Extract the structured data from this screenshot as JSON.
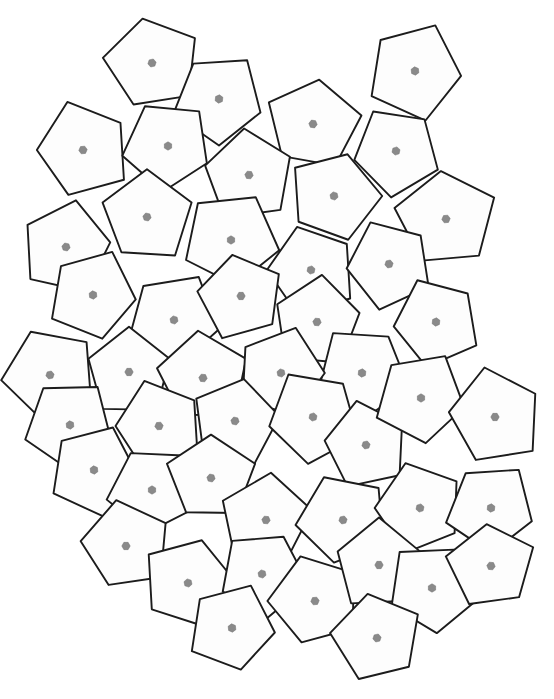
{
  "figure": {
    "kind": "geometric-tiling-diagram",
    "title": "",
    "caption": "",
    "background_color": "#ffffff",
    "canvas": {
      "width": 554,
      "height": 699
    }
  },
  "style": {
    "tile_fill": "#fdfdfd",
    "tile_stroke": "#1c1c1c",
    "tile_stroke_width": 1.9,
    "petal_light_fill": "#ededed",
    "petal_light_stroke": "#c9c9c9",
    "spine_fill": "#8f8f8f",
    "spine_stroke": "#7a7a7a",
    "ray_stroke": "#b4b4b4",
    "web_stroke": "#cdcdcd",
    "hub_fill": "#8a8a8a",
    "hub_stroke": "#6e6e6e"
  },
  "motif": {
    "name": "six-petal-rosette",
    "petal_count": 6,
    "spine_count": 6,
    "ray_count": 24,
    "hub_shape": "hexagon",
    "hub_radius": 4.2,
    "description": "Each pentagonal tile carries a six-fold rosette: light grey petals between darker grey lens-shaped spines radiating from a small grey hexagonal hub, overlaid by a fine grey web of straight rays."
  },
  "tiling": {
    "tile_shape": "pentagon",
    "tile_count": 48,
    "nominal_tile_radius": 46,
    "tiles": [
      {
        "id": "t01",
        "cx": 152,
        "cy": 63,
        "r": 48,
        "rot": -12
      },
      {
        "id": "t02",
        "cx": 219,
        "cy": 99,
        "r": 46,
        "rot": 36
      },
      {
        "id": "t03",
        "cx": 313,
        "cy": 124,
        "r": 47,
        "rot": 8
      },
      {
        "id": "t04",
        "cx": 415,
        "cy": 71,
        "r": 49,
        "rot": 24
      },
      {
        "id": "t05",
        "cx": 83,
        "cy": 150,
        "r": 48,
        "rot": 54
      },
      {
        "id": "t06",
        "cx": 168,
        "cy": 146,
        "r": 45,
        "rot": -30
      },
      {
        "id": "t07",
        "cx": 249,
        "cy": 175,
        "r": 47,
        "rot": 66
      },
      {
        "id": "t08",
        "cx": 334,
        "cy": 196,
        "r": 46,
        "rot": 18
      },
      {
        "id": "t09",
        "cx": 396,
        "cy": 151,
        "r": 45,
        "rot": 42
      },
      {
        "id": "t10",
        "cx": 446,
        "cy": 219,
        "r": 50,
        "rot": -6
      },
      {
        "id": "t11",
        "cx": 66,
        "cy": 247,
        "r": 47,
        "rot": 12
      },
      {
        "id": "t12",
        "cx": 147,
        "cy": 217,
        "r": 46,
        "rot": 72
      },
      {
        "id": "t13",
        "cx": 231,
        "cy": 240,
        "r": 48,
        "rot": 30
      },
      {
        "id": "t14",
        "cx": 311,
        "cy": 270,
        "r": 46,
        "rot": -18
      },
      {
        "id": "t15",
        "cx": 389,
        "cy": 264,
        "r": 45,
        "rot": 48
      },
      {
        "id": "t16",
        "cx": 93,
        "cy": 295,
        "r": 45,
        "rot": 24
      },
      {
        "id": "t17",
        "cx": 174,
        "cy": 320,
        "r": 47,
        "rot": -42
      },
      {
        "id": "t18",
        "cx": 241,
        "cy": 296,
        "r": 44,
        "rot": 60
      },
      {
        "id": "t19",
        "cx": 317,
        "cy": 322,
        "r": 46,
        "rot": 6
      },
      {
        "id": "t20",
        "cx": 362,
        "cy": 373,
        "r": 47,
        "rot": 36
      },
      {
        "id": "t21",
        "cx": 436,
        "cy": 322,
        "r": 45,
        "rot": -24
      },
      {
        "id": "t22",
        "cx": 50,
        "cy": 375,
        "r": 47,
        "rot": 48
      },
      {
        "id": "t23",
        "cx": 129,
        "cy": 372,
        "r": 45,
        "rot": 0
      },
      {
        "id": "t24",
        "cx": 203,
        "cy": 378,
        "r": 46,
        "rot": 66
      },
      {
        "id": "t25",
        "cx": 281,
        "cy": 373,
        "r": 45,
        "rot": 18
      },
      {
        "id": "t26",
        "cx": 70,
        "cy": 425,
        "r": 45,
        "rot": -36
      },
      {
        "id": "t27",
        "cx": 159,
        "cy": 426,
        "r": 46,
        "rot": 54
      },
      {
        "id": "t28",
        "cx": 235,
        "cy": 421,
        "r": 45,
        "rot": 12
      },
      {
        "id": "t29",
        "cx": 313,
        "cy": 417,
        "r": 47,
        "rot": 42
      },
      {
        "id": "t30",
        "cx": 366,
        "cy": 445,
        "r": 44,
        "rot": -12
      },
      {
        "id": "t31",
        "cx": 421,
        "cy": 398,
        "r": 46,
        "rot": 30
      },
      {
        "id": "t32",
        "cx": 495,
        "cy": 417,
        "r": 48,
        "rot": 60
      },
      {
        "id": "t33",
        "cx": 94,
        "cy": 470,
        "r": 46,
        "rot": 24
      },
      {
        "id": "t34",
        "cx": 152,
        "cy": 490,
        "r": 45,
        "rot": -30
      },
      {
        "id": "t35",
        "cx": 211,
        "cy": 478,
        "r": 44,
        "rot": 72
      },
      {
        "id": "t36",
        "cx": 266,
        "cy": 520,
        "r": 46,
        "rot": 6
      },
      {
        "id": "t37",
        "cx": 343,
        "cy": 520,
        "r": 46,
        "rot": 48
      },
      {
        "id": "t38",
        "cx": 420,
        "cy": 508,
        "r": 45,
        "rot": -18
      },
      {
        "id": "t39",
        "cx": 491,
        "cy": 508,
        "r": 45,
        "rot": 36
      },
      {
        "id": "t40",
        "cx": 126,
        "cy": 546,
        "r": 45,
        "rot": 60
      },
      {
        "id": "t41",
        "cx": 188,
        "cy": 583,
        "r": 46,
        "rot": 18
      },
      {
        "id": "t42",
        "cx": 262,
        "cy": 574,
        "r": 45,
        "rot": -42
      },
      {
        "id": "t43",
        "cx": 315,
        "cy": 601,
        "r": 46,
        "rot": 54
      },
      {
        "id": "t44",
        "cx": 379,
        "cy": 565,
        "r": 45,
        "rot": 0
      },
      {
        "id": "t45",
        "cx": 432,
        "cy": 588,
        "r": 46,
        "rot": 30
      },
      {
        "id": "t46",
        "cx": 491,
        "cy": 566,
        "r": 44,
        "rot": 66
      },
      {
        "id": "t47",
        "cx": 232,
        "cy": 628,
        "r": 44,
        "rot": 24
      },
      {
        "id": "t48",
        "cx": 377,
        "cy": 638,
        "r": 45,
        "rot": -12
      }
    ]
  }
}
